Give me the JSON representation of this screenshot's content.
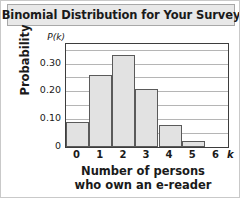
{
  "chart_data": {
    "type": "bar",
    "title": "Binomial Distribution for Your Survey",
    "xlabel_line1": "Number of persons",
    "xlabel_line2": "who own an e-reader",
    "ylabel": "Probability",
    "y_symbol": "P(k)",
    "x_symbol": "k",
    "categories": [
      "0",
      "1",
      "2",
      "3",
      "4",
      "5",
      "6"
    ],
    "values": [
      0.09,
      0.26,
      0.33,
      0.21,
      0.08,
      0.02,
      0.0
    ],
    "ylim": [
      0,
      0.37
    ],
    "xlim": [
      -0.5,
      6.5
    ],
    "yticks": [
      "0.30",
      "0.20",
      "0.10",
      "0"
    ],
    "ytick_values": [
      0.3,
      0.2,
      0.1,
      0
    ],
    "gridlines": [
      0.35,
      0.3,
      0.25,
      0.2,
      0.15,
      0.1,
      0.05
    ],
    "grid": true,
    "legend": false,
    "bar_fill_color": "#e2e2e2",
    "bar_edge_color": "#5a5a5a",
    "frame_color": "#3d3d3d",
    "grid_color": "#b5b5b5",
    "title_bg_color": "#e8e8e8",
    "text_color": "#1a1a1a"
  }
}
